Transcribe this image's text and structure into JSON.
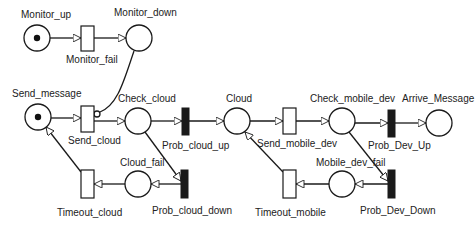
{
  "diagram": {
    "type": "petri-net",
    "places": [
      {
        "id": "monitor_up",
        "label": "Monitor_up",
        "cx": 37,
        "cy": 38,
        "tokens": 1,
        "label_x": 21,
        "label_y": 17
      },
      {
        "id": "monitor_down",
        "label": "Monitor_down",
        "cx": 139,
        "cy": 38,
        "tokens": 0,
        "label_x": 114,
        "label_y": 15
      },
      {
        "id": "send_message",
        "label": "Send_message",
        "cx": 38,
        "cy": 116,
        "tokens": 1,
        "label_x": 12,
        "label_y": 96
      },
      {
        "id": "check_cloud",
        "label": "Check_cloud",
        "cx": 138,
        "cy": 121,
        "tokens": 0,
        "label_x": 118,
        "label_y": 101
      },
      {
        "id": "cloud",
        "label": "Cloud",
        "cx": 237,
        "cy": 121,
        "tokens": 0,
        "label_x": 226,
        "label_y": 101
      },
      {
        "id": "check_mobile_dev",
        "label": "Check_mobile_dev",
        "cx": 342,
        "cy": 121,
        "tokens": 0,
        "label_x": 310,
        "label_y": 101
      },
      {
        "id": "arrive_message",
        "label": "Arrive_Message",
        "cx": 439,
        "cy": 123,
        "tokens": 0,
        "label_x": 402,
        "label_y": 101
      },
      {
        "id": "cloud_fail",
        "label": "Cloud_fail",
        "cx": 138,
        "cy": 184,
        "tokens": 0,
        "label_x": 120,
        "label_y": 165
      },
      {
        "id": "mobile_dev_fail",
        "label": "Mobile_dev_fail",
        "cx": 342,
        "cy": 184,
        "tokens": 0,
        "label_x": 316,
        "label_y": 165
      }
    ],
    "transitions": [
      {
        "id": "monitor_fail",
        "label": "Monitor_fail",
        "kind": "immediate",
        "x": 81,
        "y": 26,
        "w": 13,
        "h": 25,
        "label_x": 66,
        "label_y": 62
      },
      {
        "id": "send_cloud",
        "label": "Send_cloud",
        "kind": "immediate",
        "x": 81,
        "y": 106,
        "w": 13,
        "h": 26,
        "label_x": 68,
        "label_y": 143
      },
      {
        "id": "prob_cloud_up",
        "label": "Prob_cloud_up",
        "kind": "timed",
        "x": 182,
        "y": 108,
        "w": 7,
        "h": 27,
        "label_x": 162,
        "label_y": 148
      },
      {
        "id": "send_mobile_dev",
        "label": "Send_mobile_dev",
        "kind": "immediate",
        "x": 283,
        "y": 108,
        "w": 13,
        "h": 26,
        "label_x": 258,
        "label_y": 146
      },
      {
        "id": "prob_dev_up",
        "label": "Prob_Dev_Up",
        "kind": "timed",
        "x": 388,
        "y": 110,
        "w": 7,
        "h": 27,
        "label_x": 370,
        "label_y": 148
      },
      {
        "id": "prob_cloud_down",
        "label": "Prob_cloud_down",
        "kind": "timed",
        "x": 181,
        "y": 170,
        "w": 7,
        "h": 28,
        "label_x": 152,
        "label_y": 213
      },
      {
        "id": "timeout_cloud",
        "label": "Timeout_cloud",
        "kind": "immediate",
        "x": 81,
        "y": 170,
        "w": 13,
        "h": 28,
        "label_x": 57,
        "label_y": 215
      },
      {
        "id": "prob_dev_down",
        "label": "Prob_Dev_Down",
        "kind": "timed",
        "x": 388,
        "y": 170,
        "w": 7,
        "h": 28,
        "label_x": 360,
        "label_y": 213
      },
      {
        "id": "timeout_mobile",
        "label": "Timeout_mobile",
        "kind": "immediate",
        "x": 283,
        "y": 170,
        "w": 13,
        "h": 28,
        "label_x": 255,
        "label_y": 215
      }
    ],
    "arcs": [
      {
        "from": "monitor_up",
        "to": "monitor_fail",
        "type": "normal"
      },
      {
        "from": "monitor_fail",
        "to": "monitor_down",
        "type": "normal"
      },
      {
        "from": "monitor_down",
        "to": "send_cloud",
        "type": "inhibitor"
      },
      {
        "from": "send_message",
        "to": "send_cloud",
        "type": "normal"
      },
      {
        "from": "send_cloud",
        "to": "check_cloud",
        "type": "normal"
      },
      {
        "from": "check_cloud",
        "to": "prob_cloud_up",
        "type": "normal"
      },
      {
        "from": "prob_cloud_up",
        "to": "cloud",
        "type": "normal"
      },
      {
        "from": "cloud",
        "to": "send_mobile_dev",
        "type": "normal"
      },
      {
        "from": "send_mobile_dev",
        "to": "check_mobile_dev",
        "type": "normal"
      },
      {
        "from": "check_mobile_dev",
        "to": "prob_dev_up",
        "type": "normal"
      },
      {
        "from": "prob_dev_up",
        "to": "arrive_message",
        "type": "normal"
      },
      {
        "from": "check_cloud",
        "to": "prob_cloud_down",
        "type": "normal"
      },
      {
        "from": "prob_cloud_down",
        "to": "cloud_fail",
        "type": "normal"
      },
      {
        "from": "cloud_fail",
        "to": "timeout_cloud",
        "type": "normal"
      },
      {
        "from": "timeout_cloud",
        "to": "send_message",
        "type": "normal"
      },
      {
        "from": "check_mobile_dev",
        "to": "prob_dev_down",
        "type": "normal"
      },
      {
        "from": "prob_dev_down",
        "to": "mobile_dev_fail",
        "type": "normal"
      },
      {
        "from": "mobile_dev_fail",
        "to": "timeout_mobile",
        "type": "normal"
      },
      {
        "from": "timeout_mobile",
        "to": "cloud",
        "type": "normal"
      }
    ]
  },
  "labels": {
    "monitor_up": "Monitor_up",
    "monitor_down": "Monitor_down",
    "monitor_fail": "Monitor_fail",
    "send_message": "Send_message",
    "send_cloud": "Send_cloud",
    "check_cloud": "Check_cloud",
    "prob_cloud_up": "Prob_cloud_up",
    "cloud": "Cloud",
    "send_mobile_dev": "Send_mobile_dev",
    "check_mobile_dev": "Check_mobile_dev",
    "prob_dev_up": "Prob_Dev_Up",
    "arrive_message": "Arrive_Message",
    "cloud_fail": "Cloud_fail",
    "prob_cloud_down": "Prob_cloud_down",
    "timeout_cloud": "Timeout_cloud",
    "mobile_dev_fail": "Mobile_dev_fail",
    "prob_dev_down": "Prob_Dev_Down",
    "timeout_mobile": "Timeout_mobile"
  },
  "colors": {
    "stroke": "#1a1a1a",
    "background": "#ffffff",
    "timed_fill": "#1a1a1a",
    "immediate_fill": "#ffffff"
  }
}
